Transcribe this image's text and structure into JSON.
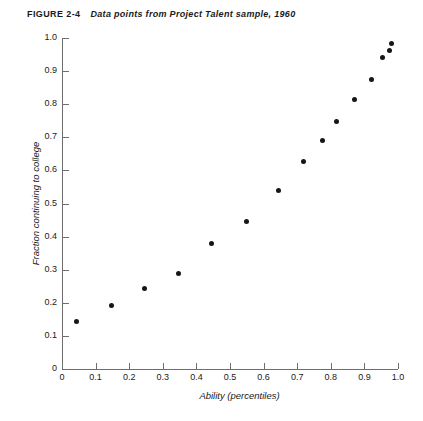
{
  "figure": {
    "label": "FIGURE 2-4",
    "title": "Data points from Project Talent sample, 1960"
  },
  "chart_data": {
    "type": "scatter",
    "title": "Data points from Project Talent sample, 1960",
    "xlabel": "Ability (percentiles)",
    "ylabel": "Fraction continuing to college",
    "xlim": [
      0,
      1.0
    ],
    "ylim": [
      0,
      1.0
    ],
    "grid": false,
    "legend": null,
    "marker": "filled-circle",
    "marker_color": "#161616",
    "xticks": [
      "0",
      "0.1",
      "0.2",
      "0.3",
      "0.4",
      "0.5",
      "0.6",
      "0.7",
      "0.8",
      "0.9",
      "1.0"
    ],
    "xtick_values": [
      0,
      0.1,
      0.2,
      0.3,
      0.4,
      0.5,
      0.6,
      0.7,
      0.8,
      0.9,
      1.0
    ],
    "yticks": [
      "0",
      "0.1",
      "0.2",
      "0.3",
      "0.4",
      "0.5",
      "0.6",
      "0.7",
      "0.8",
      "0.9",
      "1.0"
    ],
    "ytick_values": [
      0,
      0.1,
      0.2,
      0.3,
      0.4,
      0.5,
      0.6,
      0.7,
      0.8,
      0.9,
      1.0
    ],
    "x": [
      0.042,
      0.146,
      0.247,
      0.348,
      0.446,
      0.548,
      0.643,
      0.72,
      0.774,
      0.818,
      0.872,
      0.92,
      0.955,
      0.976,
      0.982
    ],
    "y": [
      0.142,
      0.193,
      0.244,
      0.289,
      0.379,
      0.446,
      0.539,
      0.627,
      0.69,
      0.747,
      0.813,
      0.876,
      0.94,
      0.961,
      0.982
    ],
    "points": [
      {
        "x": 0.042,
        "y": 0.142
      },
      {
        "x": 0.146,
        "y": 0.193
      },
      {
        "x": 0.247,
        "y": 0.244
      },
      {
        "x": 0.348,
        "y": 0.289
      },
      {
        "x": 0.446,
        "y": 0.379
      },
      {
        "x": 0.548,
        "y": 0.446
      },
      {
        "x": 0.643,
        "y": 0.539
      },
      {
        "x": 0.72,
        "y": 0.627
      },
      {
        "x": 0.774,
        "y": 0.69
      },
      {
        "x": 0.818,
        "y": 0.747
      },
      {
        "x": 0.872,
        "y": 0.813
      },
      {
        "x": 0.92,
        "y": 0.876
      },
      {
        "x": 0.955,
        "y": 0.94
      },
      {
        "x": 0.976,
        "y": 0.961
      },
      {
        "x": 0.982,
        "y": 0.982
      }
    ]
  },
  "geometry": {
    "x0_px": 62,
    "x1_px": 398,
    "y0_px": 369,
    "y1_px": 38
  }
}
